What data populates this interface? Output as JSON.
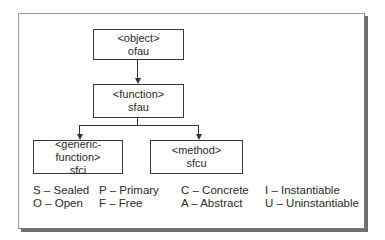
{
  "nodes": {
    "object": {
      "type": "<object>",
      "code": "ofau"
    },
    "function": {
      "type": "<function>",
      "code": "sfau"
    },
    "generic_function": {
      "type": "<generic-function>",
      "code": "sfci"
    },
    "method": {
      "type": "<method>",
      "code": "sfcu"
    }
  },
  "edges": [
    {
      "from": "object",
      "to": "function"
    },
    {
      "from": "function",
      "to": "generic_function"
    },
    {
      "from": "function",
      "to": "method"
    }
  ],
  "legend": [
    [
      "S – Sealed",
      "O – Open"
    ],
    [
      "P – Primary",
      "F – Free"
    ],
    [
      "C – Concrete",
      "A – Abstract"
    ],
    [
      "I  – Instantiable",
      "U – Uninstantiable"
    ]
  ]
}
